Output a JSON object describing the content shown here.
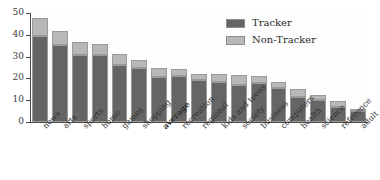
{
  "chart_data": {
    "type": "bar",
    "subtype": "stacked-bar",
    "title": "",
    "xlabel": "",
    "ylabel": "",
    "ylim": [
      0,
      50
    ],
    "yticks": [
      0,
      10,
      20,
      30,
      40,
      50
    ],
    "grid": false,
    "legend_position": "top-right",
    "categories": [
      "news",
      "arts",
      "sports",
      "home",
      "games",
      "shopping",
      "average",
      "recreation",
      "regional",
      "kids and teens",
      "society",
      "business",
      "computers",
      "health",
      "science",
      "reference",
      "adult"
    ],
    "highlighted_categories": [
      "average"
    ],
    "series": [
      {
        "name": "Tracker",
        "color": "#656565",
        "values": [
          39.4,
          35.4,
          30.8,
          30.6,
          26.1,
          24.6,
          20.7,
          21.2,
          19.4,
          18.3,
          17.1,
          18.0,
          15.7,
          11.6,
          10.0,
          6.8,
          5.0
        ]
      },
      {
        "name": "Non-Tracker",
        "color": "#b8b8b8",
        "values": [
          8.3,
          6.3,
          6.0,
          5.2,
          5.2,
          4.0,
          4.2,
          3.3,
          2.7,
          3.6,
          4.6,
          3.2,
          2.8,
          3.7,
          2.5,
          2.7,
          0.8
        ]
      }
    ],
    "totals": [
      47.7,
      41.7,
      36.8,
      35.8,
      31.3,
      28.6,
      24.9,
      24.5,
      22.1,
      21.9,
      21.7,
      21.2,
      18.5,
      15.3,
      12.5,
      9.5,
      5.8
    ]
  },
  "legend": {
    "items": [
      {
        "label": "Tracker",
        "color": "#656565"
      },
      {
        "label": "Non-Tracker",
        "color": "#b8b8b8"
      }
    ]
  },
  "axis": {
    "y_tick_labels": [
      "0",
      "10",
      "20",
      "30",
      "40",
      "50"
    ]
  }
}
